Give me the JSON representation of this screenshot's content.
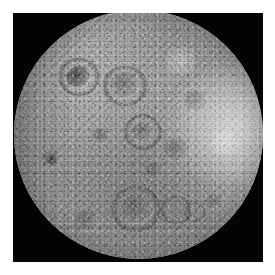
{
  "image": {
    "subject": "Moon far side",
    "description": "Grayscale photograph of the heavily cratered lunar far side, a nearly full disk centered on a black sky background",
    "colors": {
      "background": "#ffffff",
      "sky": "#040404",
      "surface_mid": "#8f8f8f",
      "surface_highlight": "#d7d7d7",
      "surface_shadow": "#3c3c3c"
    },
    "frame": {
      "margin_left": 13,
      "margin_top": 13,
      "panel_width": 250,
      "panel_height": 249
    },
    "disk": {
      "center_x": 125,
      "center_y": 121,
      "radius": 124
    },
    "features": [
      {
        "name": "dark-crater-upper-left",
        "x": 62,
        "y": 67,
        "size": 22,
        "tone": "dark"
      },
      {
        "name": "bright-limb-right",
        "x": 220,
        "y": 110,
        "size": 40,
        "tone": "bright"
      },
      {
        "name": "large-crater-lower-center",
        "x": 140,
        "y": 205,
        "size": 30,
        "tone": "ring"
      },
      {
        "name": "crater-chain-lower",
        "x": 160,
        "y": 212,
        "size": 16,
        "tone": "ring"
      },
      {
        "name": "dark-patch-left",
        "x": 44,
        "y": 158,
        "size": 18,
        "tone": "mid"
      }
    ]
  }
}
